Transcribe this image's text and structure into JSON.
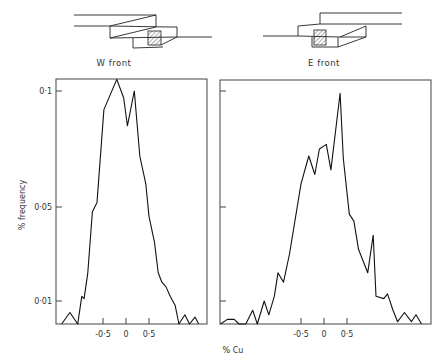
{
  "figure": {
    "panel_captions": [
      "W front",
      "E front"
    ],
    "y_axis_label": "% frequency",
    "x_axis_label": "% Cu",
    "y_ticks": [
      {
        "label": "0·1",
        "value": 0.1,
        "py": 91
      },
      {
        "label": "0·05",
        "value": 0.05,
        "py": 207
      },
      {
        "label": "0·01",
        "value": 0.01,
        "py": 301
      }
    ],
    "x_ticks": [
      {
        "label": "-0·5",
        "value": -0.5
      },
      {
        "label": "0",
        "value": 0
      },
      {
        "label": "0·5",
        "value": 0.5
      }
    ]
  },
  "chart_data": [
    {
      "type": "line",
      "title": "W front",
      "xlabel": "% Cu",
      "ylabel": "% frequency",
      "x_ticks": [
        -0.5,
        0,
        0.5
      ],
      "y_ticks": [
        0.01,
        0.05,
        0.1
      ],
      "xlim": [
        -1.4,
        1.75
      ],
      "grid": false,
      "series": [
        {
          "name": "W front",
          "points": [
            [
              -1.4,
              0.0
            ],
            [
              -1.22,
              0.005
            ],
            [
              -1.05,
              0.0
            ],
            [
              -0.96,
              0.012
            ],
            [
              -0.91,
              0.011
            ],
            [
              -0.83,
              0.022
            ],
            [
              -0.73,
              0.048
            ],
            [
              -0.63,
              0.052
            ],
            [
              -0.48,
              0.092
            ],
            [
              -0.2,
              0.105
            ],
            [
              -0.05,
              0.097
            ],
            [
              0.03,
              0.085
            ],
            [
              0.18,
              0.1
            ],
            [
              0.3,
              0.072
            ],
            [
              0.43,
              0.06
            ],
            [
              0.5,
              0.046
            ],
            [
              0.62,
              0.035
            ],
            [
              0.7,
              0.022
            ],
            [
              0.78,
              0.018
            ],
            [
              0.87,
              0.016
            ],
            [
              0.96,
              0.012
            ],
            [
              1.07,
              0.008
            ],
            [
              1.15,
              0.0
            ],
            [
              1.28,
              0.004
            ],
            [
              1.38,
              0.0
            ],
            [
              1.5,
              0.003
            ],
            [
              1.58,
              0.0
            ]
          ]
        }
      ]
    },
    {
      "type": "line",
      "title": "E front",
      "xlabel": "% Cu",
      "ylabel": "% frequency",
      "x_ticks": [
        -0.5,
        0,
        0.5
      ],
      "y_ticks": [
        0.01,
        0.05,
        0.1
      ],
      "xlim": [
        -2.25,
        2.3
      ],
      "grid": false,
      "series": [
        {
          "name": "E front",
          "points": [
            [
              -2.25,
              0.0
            ],
            [
              -2.1,
              0.002
            ],
            [
              -1.95,
              0.002
            ],
            [
              -1.85,
              0.0
            ],
            [
              -1.7,
              0.0
            ],
            [
              -1.55,
              0.006
            ],
            [
              -1.45,
              0.0
            ],
            [
              -1.3,
              0.01
            ],
            [
              -1.2,
              0.004
            ],
            [
              -1.08,
              0.012
            ],
            [
              -1.0,
              0.022
            ],
            [
              -0.88,
              0.018
            ],
            [
              -0.75,
              0.03
            ],
            [
              -0.5,
              0.06
            ],
            [
              -0.33,
              0.072
            ],
            [
              -0.2,
              0.064
            ],
            [
              -0.1,
              0.075
            ],
            [
              0.05,
              0.077
            ],
            [
              0.15,
              0.066
            ],
            [
              0.35,
              0.099
            ],
            [
              0.42,
              0.071
            ],
            [
              0.55,
              0.047
            ],
            [
              0.65,
              0.044
            ],
            [
              0.75,
              0.032
            ],
            [
              0.95,
              0.022
            ],
            [
              1.07,
              0.038
            ],
            [
              1.13,
              0.012
            ],
            [
              1.3,
              0.011
            ],
            [
              1.38,
              0.013
            ],
            [
              1.5,
              0.006
            ],
            [
              1.6,
              0.001
            ],
            [
              1.75,
              0.005
            ],
            [
              1.9,
              0.001
            ],
            [
              2.0,
              0.004
            ],
            [
              2.12,
              0.0
            ]
          ]
        }
      ]
    }
  ]
}
